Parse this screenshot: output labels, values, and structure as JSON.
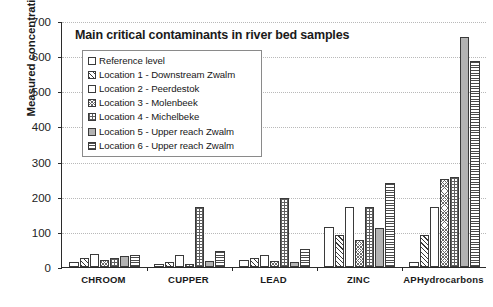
{
  "chart_data": {
    "type": "bar",
    "title": "Main critical contaminants in river bed samples",
    "xlabel": "",
    "ylabel": "Measured concentrations (mg/kg)",
    "ylim": [
      0,
      700
    ],
    "ytick_step": 100,
    "yticks": [
      "700",
      "600",
      "500",
      "400",
      "300",
      "200",
      "100",
      "0"
    ],
    "grid": true,
    "legend_position": "upper-left-inside",
    "categories": [
      "CHROOM",
      "CUPPER",
      "LEAD",
      "ZINC",
      "APHydrocarbons"
    ],
    "series": [
      {
        "name": "Reference level",
        "pattern": "empty",
        "values": [
          13,
          8,
          20,
          115,
          13
        ]
      },
      {
        "name": "Location 1 - Downstream Zwalm",
        "pattern": "diagonal",
        "values": [
          25,
          13,
          27,
          90,
          90
        ]
      },
      {
        "name": "Location 2 - Peerdestok",
        "pattern": "empty",
        "values": [
          38,
          35,
          35,
          172,
          170
        ]
      },
      {
        "name": "Location 3 - Molenbeek",
        "pattern": "fine-cross",
        "values": [
          20,
          10,
          18,
          78,
          250
        ]
      },
      {
        "name": "Location 4 - Michelbeke",
        "pattern": "grid",
        "values": [
          26,
          170,
          197,
          170,
          255
        ]
      },
      {
        "name": "Location 5 - Upper reach Zwalm",
        "pattern": "gray-solid",
        "values": [
          30,
          18,
          13,
          110,
          655
        ]
      },
      {
        "name": "Location 6 - Upper reach Zwalm",
        "pattern": "h-lines",
        "values": [
          33,
          45,
          52,
          240,
          585
        ]
      }
    ]
  },
  "colors": {
    "axis": "#2b2b2b",
    "gridline": "#b9b9b9",
    "bar_outline": "#3a3a3a",
    "gray_fill": "#b3b3b3",
    "background": "#ffffff",
    "text": "#1a1a1a"
  }
}
